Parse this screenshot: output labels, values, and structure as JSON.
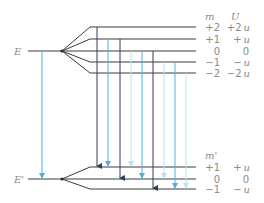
{
  "diagram": {
    "upper_level": {
      "label": "E",
      "column_headers": {
        "m": "m",
        "U": "U"
      },
      "sublevels": [
        {
          "m": "+2",
          "U": "+2",
          "U_unit": "u"
        },
        {
          "m": "+1",
          "U": "+",
          "U_unit": "u"
        },
        {
          "m": "0",
          "U": "0",
          "U_unit": ""
        },
        {
          "m": "−1",
          "U": "−",
          "U_unit": "u"
        },
        {
          "m": "−2",
          "U": "−2",
          "U_unit": "u"
        }
      ]
    },
    "lower_level": {
      "label": "E'",
      "column_headers": {
        "m": "m'"
      },
      "sublevels": [
        {
          "m": "+1",
          "U": "+",
          "U_unit": "u"
        },
        {
          "m": "0",
          "U": "0",
          "U_unit": ""
        },
        {
          "m": "−1",
          "U": "−",
          "U_unit": "u"
        }
      ]
    },
    "transitions": [
      {
        "from": "E",
        "to": "E'",
        "color": "#4fb3d9",
        "type": "unsplit"
      },
      {
        "from": "+2",
        "to": "+1",
        "color": "#2e3f5c",
        "type": "delta-m-1"
      },
      {
        "from": "+1",
        "to": "+1",
        "color": "#4fb3d9",
        "type": "delta-m-0"
      },
      {
        "from": "+1",
        "to": "0",
        "color": "#2e3f5c",
        "type": "delta-m-1"
      },
      {
        "from": "0",
        "to": "+1",
        "color": "#b9e1ef",
        "type": "delta-m-minus-1"
      },
      {
        "from": "0",
        "to": "0",
        "color": "#4fb3d9",
        "type": "delta-m-0"
      },
      {
        "from": "0",
        "to": "−1",
        "color": "#2e3f5c",
        "type": "delta-m-1"
      },
      {
        "from": "−1",
        "to": "0",
        "color": "#b9e1ef",
        "type": "delta-m-minus-1"
      },
      {
        "from": "−1",
        "to": "−1",
        "color": "#4fb3d9",
        "type": "delta-m-0"
      },
      {
        "from": "−2",
        "to": "−1",
        "color": "#b9e1ef",
        "type": "delta-m-minus-1"
      }
    ],
    "colors": {
      "level_line": "#3a3a3a",
      "label_text": "#8a8a8a",
      "dark_arrow": "#2e3f5c",
      "cyan_arrow": "#4fb3d9",
      "pale_arrow": "#b9e1ef"
    }
  }
}
